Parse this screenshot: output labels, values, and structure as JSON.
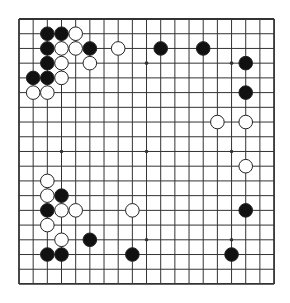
{
  "board": {
    "size": 19,
    "origin_x": 19,
    "origin_y": 19,
    "spacing_x": 14.17,
    "spacing_y": 14.72,
    "line_color": "#333333",
    "background": "#ffffff",
    "stone_radius": 6.8,
    "star_points": [
      [
        3,
        3
      ],
      [
        9,
        3
      ],
      [
        15,
        3
      ],
      [
        3,
        9
      ],
      [
        9,
        9
      ],
      [
        15,
        9
      ],
      [
        3,
        15
      ],
      [
        9,
        15
      ],
      [
        15,
        15
      ]
    ],
    "black_stones": [
      [
        2,
        1
      ],
      [
        3,
        1
      ],
      [
        2,
        2
      ],
      [
        5,
        2
      ],
      [
        10,
        2
      ],
      [
        13,
        2
      ],
      [
        2,
        3
      ],
      [
        16,
        3
      ],
      [
        1,
        4
      ],
      [
        2,
        4
      ],
      [
        16,
        5
      ],
      [
        3,
        12
      ],
      [
        2,
        13
      ],
      [
        16,
        13
      ],
      [
        5,
        15
      ],
      [
        2,
        16
      ],
      [
        3,
        16
      ],
      [
        8,
        16
      ],
      [
        15,
        16
      ]
    ],
    "white_stones": [
      [
        4,
        1
      ],
      [
        3,
        2
      ],
      [
        4,
        2
      ],
      [
        7,
        2
      ],
      [
        3,
        3
      ],
      [
        5,
        3
      ],
      [
        3,
        4
      ],
      [
        1,
        5
      ],
      [
        2,
        5
      ],
      [
        14,
        7
      ],
      [
        16,
        7
      ],
      [
        16,
        10
      ],
      [
        2,
        11
      ],
      [
        2,
        12
      ],
      [
        3,
        13
      ],
      [
        4,
        13
      ],
      [
        8,
        13
      ],
      [
        2,
        14
      ],
      [
        3,
        15
      ]
    ],
    "colors": {
      "black": "#111111",
      "white": "#ffffff",
      "stone_outline": "#222222"
    }
  }
}
